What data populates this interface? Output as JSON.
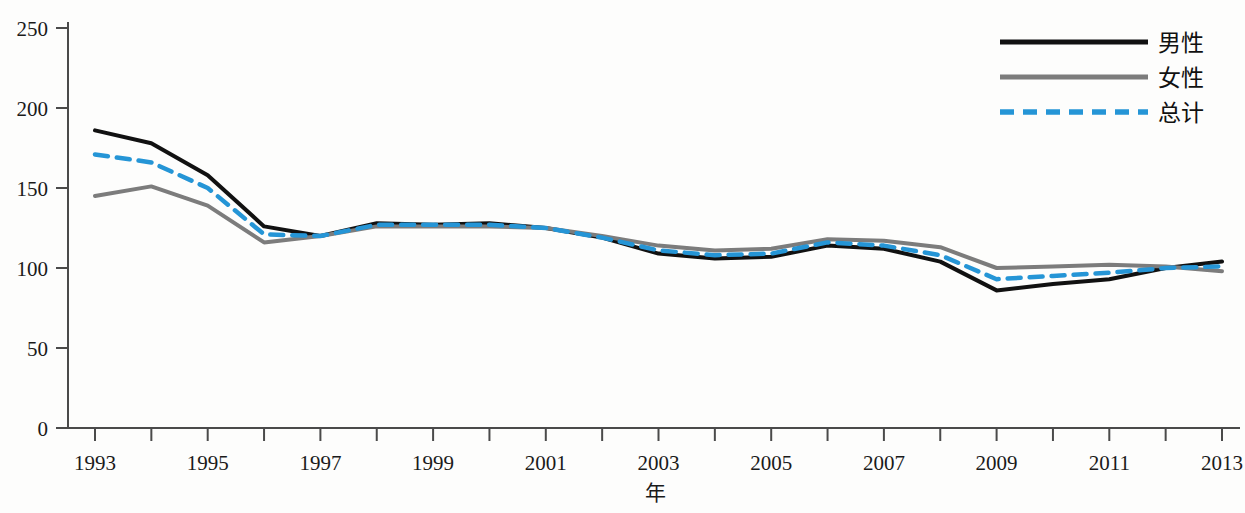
{
  "chart_data": {
    "type": "line",
    "title": "",
    "xlabel": "年",
    "ylabel": "",
    "xlim": [
      1993,
      2013
    ],
    "ylim": [
      0,
      250
    ],
    "grid": false,
    "legend_position": "top-right",
    "x": [
      1993,
      1994,
      1995,
      1996,
      1997,
      1998,
      1999,
      2000,
      2001,
      2002,
      2003,
      2004,
      2005,
      2006,
      2007,
      2008,
      2009,
      2010,
      2011,
      2012,
      2013
    ],
    "x_tick_labels": [
      "1993",
      "",
      "1995",
      "",
      "1997",
      "",
      "1999",
      "",
      "2001",
      "",
      "2003",
      "",
      "2005",
      "",
      "2007",
      "",
      "2009",
      "",
      "2011",
      "",
      "2013"
    ],
    "y_ticks": [
      0,
      50,
      100,
      150,
      200,
      250
    ],
    "y_tick_labels": [
      "0",
      "50",
      "100",
      "150",
      "200",
      "250"
    ],
    "series": [
      {
        "name": "男性",
        "color": "#111111",
        "style": "solid",
        "width": 4,
        "values": [
          186,
          178,
          158,
          126,
          120,
          128,
          127,
          128,
          125,
          119,
          109,
          106,
          107,
          114,
          112,
          104,
          86,
          90,
          93,
          100,
          104
        ]
      },
      {
        "name": "女性",
        "color": "#7c7c7c",
        "style": "solid",
        "width": 4,
        "values": [
          145,
          151,
          139,
          116,
          120,
          126,
          126,
          126,
          125,
          120,
          114,
          111,
          112,
          118,
          117,
          113,
          100,
          101,
          102,
          101,
          98
        ]
      },
      {
        "name": "总计",
        "color": "#2595d6",
        "style": "dashed",
        "width": 4.5,
        "values": [
          171,
          166,
          150,
          121,
          120,
          127,
          127,
          127,
          125,
          119,
          111,
          108,
          109,
          116,
          114,
          108,
          93,
          95,
          97,
          100,
          101
        ]
      }
    ]
  },
  "legend": {
    "items": [
      {
        "label": "男性"
      },
      {
        "label": "女性"
      },
      {
        "label": "总计"
      }
    ]
  },
  "axes": {
    "x_axis_title": "年",
    "y_axis_title": ""
  }
}
